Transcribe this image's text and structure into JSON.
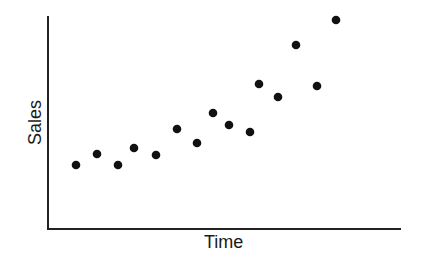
{
  "chart_data": {
    "type": "scatter",
    "title": "",
    "xlabel": "Time",
    "ylabel": "Sales",
    "grid": false,
    "legend": null,
    "ticks": "none",
    "x": [
      1,
      2,
      3,
      4,
      5,
      6,
      7,
      8,
      9,
      10,
      11,
      12,
      13,
      14,
      15
    ],
    "values": [
      30,
      35,
      30,
      38,
      35,
      47,
      41,
      55,
      49,
      46,
      68,
      62,
      86,
      67,
      100
    ],
    "points_px": [
      [
        76,
        165
      ],
      [
        97,
        154
      ],
      [
        118,
        165
      ],
      [
        134,
        148
      ],
      [
        156,
        155
      ],
      [
        177,
        129
      ],
      [
        197,
        143
      ],
      [
        213,
        113
      ],
      [
        229,
        125
      ],
      [
        250,
        132
      ],
      [
        259,
        84
      ],
      [
        278,
        97
      ],
      [
        296,
        45
      ],
      [
        317,
        86
      ],
      [
        336,
        20
      ]
    ],
    "colors": {
      "point": "#111111",
      "axis": "#222222"
    }
  }
}
